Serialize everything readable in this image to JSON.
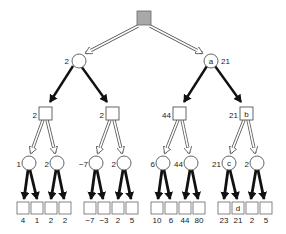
{
  "diagram": {
    "type": "minimax game tree",
    "root": {
      "shape": "square",
      "fill": "#a8a8a8"
    },
    "level1": [
      {
        "value": "2",
        "label": ""
      },
      {
        "value": "21",
        "label": "a"
      }
    ],
    "level2": [
      {
        "value": "2",
        "label": ""
      },
      {
        "value": "2",
        "label": ""
      },
      {
        "value": "44",
        "label": ""
      },
      {
        "value": "21",
        "label": "b"
      }
    ],
    "level3": [
      {
        "value": "1",
        "label": ""
      },
      {
        "value": "2",
        "label": ""
      },
      {
        "value": "−7",
        "label": ""
      },
      {
        "value": "2",
        "label": ""
      },
      {
        "value": "6",
        "label": ""
      },
      {
        "value": "44",
        "label": ""
      },
      {
        "value": "21",
        "label": "c"
      },
      {
        "value": "2",
        "label": ""
      }
    ],
    "leaves": [
      {
        "value": "4",
        "label": ""
      },
      {
        "value": "1",
        "label": ""
      },
      {
        "value": "2",
        "label": ""
      },
      {
        "value": "2",
        "label": ""
      },
      {
        "value": "−7",
        "label": ""
      },
      {
        "value": "−3",
        "label": ""
      },
      {
        "value": "2",
        "label": ""
      },
      {
        "value": "5",
        "label": ""
      },
      {
        "value": "10",
        "label": ""
      },
      {
        "value": "6",
        "label": ""
      },
      {
        "value": "44",
        "label": ""
      },
      {
        "value": "80",
        "label": ""
      },
      {
        "value": "23",
        "label": ""
      },
      {
        "value": "21",
        "label": "d"
      },
      {
        "value": "2",
        "label": ""
      },
      {
        "value": "5",
        "label": ""
      }
    ]
  }
}
